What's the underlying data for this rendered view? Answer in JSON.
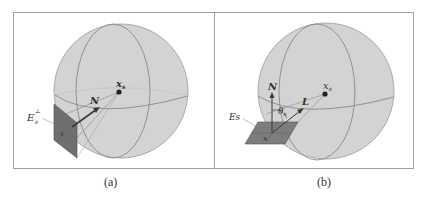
{
  "figure": {
    "panels": [
      {
        "id": "a",
        "caption": "(a)",
        "labels": {
          "point": "x",
          "point_sub": "s",
          "normal": "N",
          "plane_symbol": "E",
          "plane_sub": "s",
          "plane_sup": "⊥",
          "patch_point": "x"
        }
      },
      {
        "id": "b",
        "caption": "(b)",
        "labels": {
          "point": "x",
          "point_sub": "s",
          "normal": "N",
          "light": "L",
          "angle": "θ",
          "angle_sub": "s",
          "plane": "Es",
          "patch_point": "x"
        }
      }
    ],
    "colors": {
      "sphere_fill": "#d3d3d3",
      "sphere_stroke": "#8a8a8a",
      "plane_a": "#6f6f6f",
      "plane_b": "#7d7d7d",
      "frame": "#a0a0a0",
      "ink": "#333333"
    }
  }
}
